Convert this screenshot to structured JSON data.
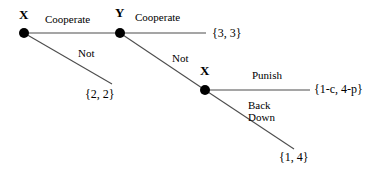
{
  "diagram": {
    "type": "extensive-form-game-tree",
    "colors": {
      "background": "#ffffff",
      "line": "#4d4d4d",
      "node": "#000000",
      "text": "#000000"
    },
    "nodes": [
      {
        "id": "x1",
        "label": "X",
        "x": 24,
        "y": 33,
        "label_x": 19,
        "label_y": 8
      },
      {
        "id": "y1",
        "label": "Y",
        "x": 120,
        "y": 33,
        "label_x": 115,
        "label_y": 6
      },
      {
        "id": "x2",
        "label": "X",
        "x": 205,
        "y": 90,
        "label_x": 200,
        "label_y": 64
      }
    ],
    "edges": [
      {
        "id": "x1-cooperate",
        "label": "Cooperate",
        "from": "x1",
        "to": "y1",
        "label_x": 45,
        "label_y": 14
      },
      {
        "id": "x1-not",
        "label": "Not",
        "from": "x1",
        "to": "terminal-22",
        "label_x": 78,
        "label_y": 48
      },
      {
        "id": "y1-cooperate",
        "label": "Cooperate",
        "from": "y1",
        "to": "terminal-33",
        "label_x": 135,
        "label_y": 12
      },
      {
        "id": "y1-not",
        "label": "Not",
        "from": "y1",
        "to": "x2",
        "label_x": 172,
        "label_y": 53
      },
      {
        "id": "x2-punish",
        "label": "Punish",
        "from": "x2",
        "to": "terminal-1c4p",
        "label_x": 252,
        "label_y": 70
      },
      {
        "id": "x2-backdown",
        "label_line1": "Back",
        "label_line2": "Down",
        "from": "x2",
        "to": "terminal-14",
        "label_x": 248,
        "label_y": 100
      }
    ],
    "payoffs": [
      {
        "id": "terminal-33",
        "label": "{3, 3}",
        "x": 212,
        "y": 27
      },
      {
        "id": "terminal-22",
        "label": "{2, 2}",
        "x": 85,
        "y": 88
      },
      {
        "id": "terminal-1c4p",
        "label": "{1-c, 4-p}",
        "x": 314,
        "y": 83
      },
      {
        "id": "terminal-14",
        "label": "{1, 4}",
        "x": 279,
        "y": 151
      }
    ]
  }
}
